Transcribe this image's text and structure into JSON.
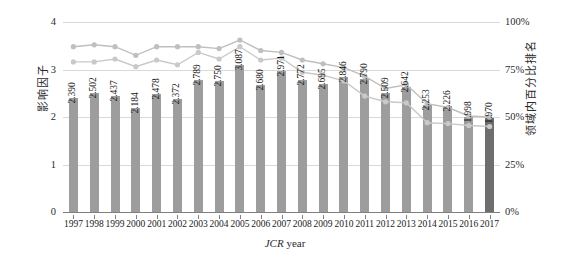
{
  "chart_data": {
    "type": "bar",
    "title": "",
    "subtitle": "",
    "xlabel_prefix": "JCR",
    "xlabel_suffix": " year",
    "xlabel": "JCR year",
    "ylabel_left": "影响因子",
    "ylabel_right": "领域内百分比排名",
    "grid": true,
    "legend": "none",
    "categories": [
      "1997",
      "1998",
      "1999",
      "2000",
      "2001",
      "2002",
      "2003",
      "2004",
      "2005",
      "2006",
      "2007",
      "2008",
      "2009",
      "2010",
      "2011",
      "2012",
      "2013",
      "2014",
      "2015",
      "2016",
      "2017"
    ],
    "ylim_left": [
      0,
      4
    ],
    "yticks_left": [
      "0",
      "1",
      "2",
      "3",
      "4"
    ],
    "ytick_values_left": [
      0,
      1,
      2,
      3,
      4
    ],
    "ylim_right": [
      0,
      100
    ],
    "yticks_right": [
      "0%",
      "25%",
      "50%",
      "75%",
      "100%"
    ],
    "ytick_values_right": [
      0,
      25,
      50,
      75,
      100
    ],
    "series": [
      {
        "name": "impact-factor-bars",
        "axis": "left",
        "type": "bar",
        "color": "#9d9d9d",
        "highlight_color": "#6e6e6e",
        "highlight_index": 20,
        "values": [
          2.39,
          2.502,
          2.437,
          2.184,
          2.478,
          2.372,
          2.789,
          2.75,
          3.087,
          2.68,
          2.971,
          2.772,
          2.695,
          2.846,
          2.79,
          2.509,
          2.642,
          2.253,
          2.226,
          1.998,
          1.97
        ],
        "labels": [
          "2.390",
          "2.502",
          "2.437",
          "2.184",
          "2.478",
          "2.372",
          "2.789",
          "2.750",
          "3.087",
          "2.680",
          "2.971",
          "2.772",
          "2.695",
          "2.846",
          "2.790",
          "2.509",
          "2.642",
          "2.253",
          "2.226",
          "1.998",
          "1.970"
        ]
      },
      {
        "name": "percentile-rank-upper-line",
        "axis": "right",
        "type": "line",
        "color": "#bfbfbf",
        "values": [
          87.0,
          88.0,
          87.0,
          82.5,
          87.0,
          87.0,
          87.0,
          86.0,
          90.5,
          85.0,
          84.0,
          80.0,
          78.0,
          76.0,
          71.5,
          65.0,
          67.0,
          57.0,
          55.0,
          50.5,
          50.0
        ]
      },
      {
        "name": "percentile-rank-lower-line",
        "axis": "right",
        "type": "line",
        "color": "#c9c9c9",
        "values": [
          79.0,
          79.0,
          80.5,
          76.5,
          80.0,
          77.5,
          84.0,
          80.5,
          87.0,
          80.0,
          81.0,
          73.5,
          72.0,
          69.0,
          61.0,
          58.0,
          57.5,
          47.0,
          46.5,
          45.5,
          45.0
        ]
      }
    ]
  }
}
